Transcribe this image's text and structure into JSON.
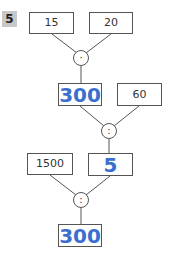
{
  "exercise_number": "5",
  "tree": {
    "level1": {
      "left": "15",
      "right": "20",
      "operator": "·"
    },
    "level2": {
      "result": "300",
      "right": "60",
      "operator": ":"
    },
    "level3": {
      "left": "1500",
      "result": "5",
      "operator": ":"
    },
    "final": {
      "result": "300"
    }
  },
  "colors": {
    "answer": "#3a6fd0",
    "border": "#555555",
    "label_bg": "#c8c8c8"
  }
}
